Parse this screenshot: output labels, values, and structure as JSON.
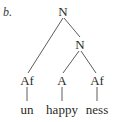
{
  "example_marker": "b.",
  "tree": {
    "nodes": [
      {
        "id": "root",
        "label": "N",
        "x": 63,
        "y": 5
      },
      {
        "id": "n2",
        "label": "N",
        "x": 80,
        "y": 38
      },
      {
        "id": "af1",
        "label": "Af",
        "x": 27,
        "y": 74
      },
      {
        "id": "a",
        "label": "A",
        "x": 62,
        "y": 74
      },
      {
        "id": "af2",
        "label": "Af",
        "x": 97,
        "y": 74
      }
    ],
    "leaves": [
      {
        "id": "un",
        "label": "un",
        "x": 27,
        "y": 103
      },
      {
        "id": "happy",
        "label": "happy",
        "x": 62,
        "y": 103
      },
      {
        "id": "ness",
        "label": "ness",
        "x": 97,
        "y": 103
      }
    ],
    "edges": [
      {
        "from": "root",
        "to": "af1",
        "x1": 63,
        "y1": 18,
        "x2": 28,
        "y2": 73
      },
      {
        "from": "root",
        "to": "n2",
        "x1": 64,
        "y1": 18,
        "x2": 80,
        "y2": 37
      },
      {
        "from": "n2",
        "to": "a",
        "x1": 79,
        "y1": 51,
        "x2": 63,
        "y2": 73
      },
      {
        "from": "n2",
        "to": "af2",
        "x1": 81,
        "y1": 51,
        "x2": 96,
        "y2": 73
      },
      {
        "from": "af1",
        "to": "un",
        "x1": 27,
        "y1": 87,
        "x2": 27,
        "y2": 101
      },
      {
        "from": "a",
        "to": "happy",
        "x1": 62,
        "y1": 87,
        "x2": 62,
        "y2": 101
      },
      {
        "from": "af2",
        "to": "ness",
        "x1": 97,
        "y1": 87,
        "x2": 97,
        "y2": 101
      }
    ]
  }
}
